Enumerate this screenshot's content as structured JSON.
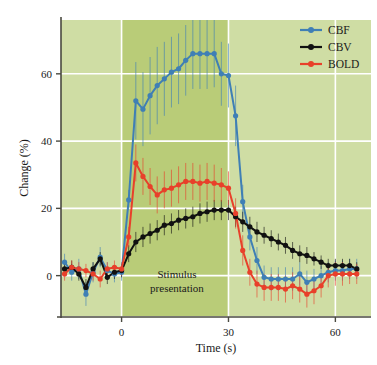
{
  "chart_data": {
    "type": "line",
    "title": "",
    "xlabel": "Time (s)",
    "ylabel": "Change (%)",
    "xlim": [
      -17,
      70
    ],
    "ylim": [
      -12,
      76
    ],
    "xticks": [
      0,
      30,
      60
    ],
    "yticks": [
      0,
      20,
      40,
      60
    ],
    "grid": "horizontal and vertical white gridlines at ticks",
    "legend_position": "top-right",
    "background": "light green plot panel with darker green shaded stimulus band",
    "annotations": [
      {
        "text_line1": "Stimulus",
        "text_line2": "presentation",
        "x_start": 0,
        "x_end": 30,
        "label_x": 15,
        "label_y": -4
      }
    ],
    "x": [
      -16,
      -14,
      -12,
      -10,
      -8,
      -6,
      -4,
      -2,
      0,
      2,
      4,
      6,
      8,
      10,
      12,
      14,
      16,
      18,
      20,
      22,
      24,
      26,
      28,
      30,
      32,
      34,
      36,
      38,
      40,
      42,
      44,
      46,
      48,
      50,
      52,
      54,
      56,
      58,
      60,
      62,
      64,
      66
    ],
    "series": [
      {
        "name": "CBF",
        "color": "#3f7fb5",
        "marker": "circle",
        "values": [
          4.0,
          1.0,
          2.0,
          -5.5,
          1.0,
          5.5,
          1.5,
          0.5,
          1.0,
          22.5,
          52.0,
          49.5,
          53.5,
          56.5,
          58.5,
          60.5,
          61.5,
          64.0,
          66.0,
          66.0,
          66.0,
          66.0,
          60.0,
          59.5,
          47.5,
          22.0,
          11.5,
          4.5,
          -0.5,
          -1.0,
          -1.0,
          -1.0,
          -1.0,
          0.5,
          -2.0,
          -1.0,
          0.0,
          1.0,
          1.5,
          1.5,
          2.0,
          2.0
        ],
        "errors": [
          2.5,
          2.5,
          3.0,
          3.5,
          3.0,
          3.0,
          2.5,
          2.5,
          2.5,
          3.0,
          11.5,
          11.0,
          11.5,
          11.5,
          11.0,
          10.5,
          10.5,
          10.5,
          10.5,
          10.5,
          10.5,
          10.0,
          9.5,
          9.5,
          9.0,
          5.0,
          4.0,
          4.0,
          3.5,
          3.5,
          3.5,
          3.5,
          3.5,
          3.5,
          3.5,
          3.0,
          3.0,
          3.0,
          3.0,
          3.0,
          3.0,
          3.0
        ]
      },
      {
        "name": "CBV",
        "color": "#111111",
        "marker": "circle",
        "values": [
          2.0,
          2.5,
          0.5,
          -3.5,
          2.0,
          5.0,
          -0.5,
          1.0,
          1.5,
          6.5,
          10.0,
          11.5,
          12.5,
          13.5,
          15.0,
          15.5,
          16.5,
          17.0,
          17.5,
          18.5,
          19.0,
          19.5,
          19.5,
          19.5,
          17.5,
          16.0,
          14.5,
          13.0,
          12.0,
          11.0,
          10.0,
          9.0,
          7.5,
          6.5,
          6.0,
          5.0,
          4.0,
          3.0,
          3.0,
          3.0,
          3.0,
          2.0
        ],
        "errors": [
          2.0,
          2.0,
          2.0,
          2.5,
          2.0,
          2.0,
          2.0,
          2.0,
          2.0,
          2.5,
          3.0,
          3.0,
          3.0,
          3.0,
          3.0,
          3.0,
          3.0,
          3.0,
          3.0,
          3.0,
          3.0,
          3.0,
          3.0,
          3.0,
          3.0,
          3.0,
          3.0,
          3.0,
          2.5,
          2.5,
          2.5,
          2.5,
          2.5,
          2.5,
          2.5,
          2.0,
          2.0,
          2.0,
          2.0,
          2.0,
          2.0,
          2.0
        ]
      },
      {
        "name": "BOLD",
        "color": "#e8402a",
        "marker": "circle",
        "values": [
          0.5,
          2.5,
          2.0,
          1.5,
          0.5,
          -1.0,
          2.0,
          2.5,
          2.0,
          11.5,
          33.5,
          29.5,
          26.5,
          24.0,
          25.5,
          26.0,
          27.0,
          28.0,
          28.0,
          27.5,
          28.0,
          27.5,
          27.0,
          26.0,
          18.5,
          7.5,
          1.0,
          -2.5,
          -3.5,
          -3.5,
          -3.5,
          -4.0,
          -3.0,
          -4.0,
          -5.5,
          -4.5,
          -3.0,
          0.0,
          0.5,
          0.5,
          0.5,
          0.5
        ],
        "errors": [
          2.0,
          2.0,
          2.0,
          2.0,
          2.0,
          2.5,
          2.0,
          2.0,
          2.0,
          3.0,
          5.5,
          5.5,
          5.5,
          5.5,
          5.5,
          5.5,
          5.5,
          5.5,
          5.5,
          5.5,
          5.5,
          5.5,
          5.0,
          5.0,
          4.5,
          4.5,
          4.0,
          4.0,
          4.0,
          4.0,
          4.0,
          4.0,
          4.0,
          4.0,
          4.0,
          4.0,
          3.5,
          3.5,
          3.5,
          3.5,
          3.0,
          3.0
        ]
      }
    ],
    "colors": {
      "panel_background": "#cfdda4",
      "stimulus_band": "#b9cc78",
      "gridline": "#ffffff",
      "axis": "#4a4a40",
      "cbf": "#3f7fb5",
      "cbv": "#111111",
      "bold": "#e8402a"
    }
  },
  "legend": {
    "items": [
      {
        "label": "CBF",
        "color": "#3f7fb5"
      },
      {
        "label": "CBV",
        "color": "#111111"
      },
      {
        "label": "BOLD",
        "color": "#e8402a"
      }
    ]
  },
  "axes": {
    "y_title": "Change (%)",
    "x_title": "Time (s)",
    "y_ticks": [
      "0",
      "20",
      "40",
      "60"
    ],
    "x_ticks": [
      "0",
      "30",
      "60"
    ]
  },
  "annotation": {
    "line1": "Stimulus",
    "line2": "presentation"
  }
}
